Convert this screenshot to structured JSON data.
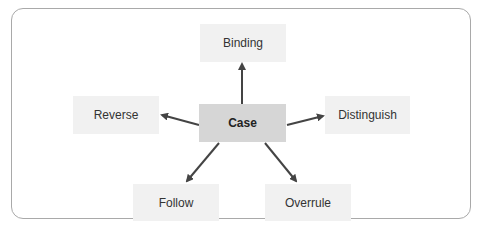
{
  "diagram": {
    "center": {
      "label": "Case"
    },
    "nodes": [
      {
        "id": "binding",
        "label": "Binding"
      },
      {
        "id": "reverse",
        "label": "Reverse"
      },
      {
        "id": "distinguish",
        "label": "Distinguish"
      },
      {
        "id": "follow",
        "label": "Follow"
      },
      {
        "id": "overrule",
        "label": "Overrule"
      }
    ],
    "edges": [
      {
        "from": "Case",
        "to": "Binding"
      },
      {
        "from": "Case",
        "to": "Reverse"
      },
      {
        "from": "Case",
        "to": "Distinguish"
      },
      {
        "from": "Case",
        "to": "Follow"
      },
      {
        "from": "Case",
        "to": "Overrule"
      }
    ],
    "colors": {
      "frame_border": "#a9a9a9",
      "node_fill": "#f1f1f1",
      "center_fill": "#d6d6d6",
      "arrow": "#444444"
    }
  }
}
